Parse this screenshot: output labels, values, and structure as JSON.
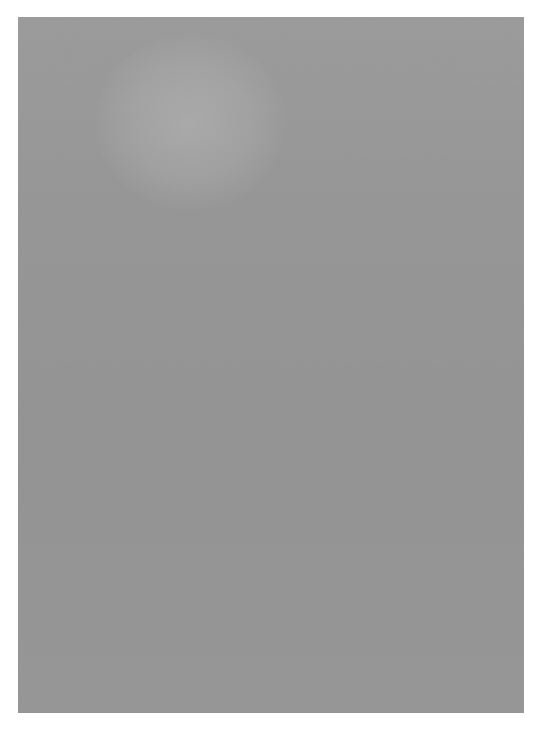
{
  "image": {
    "kind": "grayscale-grain-texture",
    "description": "Full-frame monochrome film-grain / noise texture panel on a white page background. No interface chrome, no text, no icons, no data markings are present anywhere in the frame.",
    "canvas": {
      "width_px": 545,
      "height_px": 729,
      "background_color": "#ffffff"
    },
    "panel": {
      "left_px": 18,
      "top_px": 17,
      "width_px": 506,
      "height_px": 696,
      "base_color": "#8a8a8a",
      "margin_left_px": 18,
      "margin_top_px": 17,
      "margin_right_px": 21,
      "margin_bottom_px": 16
    },
    "texture": {
      "pattern": "anisotropic vertical streak grain",
      "grain_width_px": 1.5,
      "grain_height_px": 4,
      "orientation": "vertical",
      "mean_value": "#8a8a8a",
      "dark_extreme": "#3a3a3a",
      "light_extreme": "#d8d8d8",
      "contrast": "medium",
      "saturation": "none (neutral gray)"
    },
    "features": [
      {
        "name": "light-patch-upper-left",
        "description": "subtle brighter blotch",
        "center_x_px": 190,
        "center_y_px": 122,
        "width_px": 190,
        "height_px": 175
      }
    ],
    "palette": {
      "page": "#ffffff",
      "texture_mid": "#8a8a8a",
      "texture_dark": "#3a3a3a",
      "texture_light": "#d8d8d8"
    }
  }
}
